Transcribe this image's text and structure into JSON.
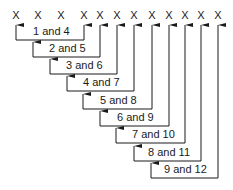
{
  "diagram": {
    "markers": [
      "X",
      "X",
      "X",
      "X",
      "X",
      "X",
      "X",
      "X",
      "X",
      "X",
      "X",
      "X"
    ],
    "pairs": [
      {
        "label": "1 and 4"
      },
      {
        "label": "2 and 5"
      },
      {
        "label": "3 and 6"
      },
      {
        "label": "4 and 7"
      },
      {
        "label": "5 and 8"
      },
      {
        "label": "6 and 9"
      },
      {
        "label": "7 and 10"
      },
      {
        "label": "8 and 11"
      },
      {
        "label": "9 and 12"
      }
    ],
    "colors": {
      "ink": "#1a1a1a",
      "background": "#ffffff"
    }
  }
}
